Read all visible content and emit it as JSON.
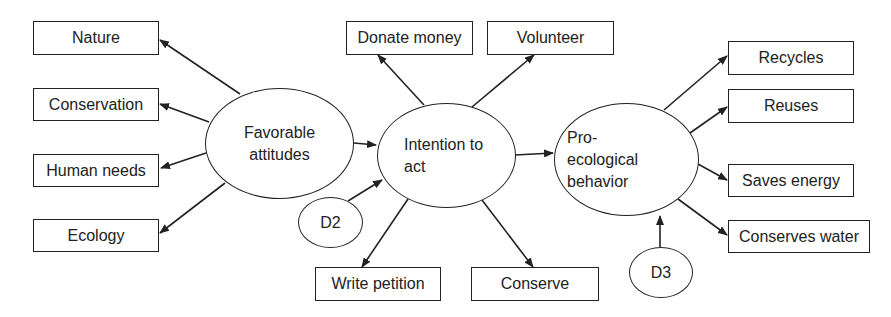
{
  "diagram": {
    "type": "structural-equation-model",
    "latent_constructs": [
      {
        "id": "favorable",
        "label_lines": [
          "Favorable",
          "attitudes"
        ]
      },
      {
        "id": "intention",
        "label_lines": [
          "Intention to",
          "act"
        ]
      },
      {
        "id": "proeco",
        "label_lines": [
          "Pro-",
          "ecological",
          "behavior"
        ]
      }
    ],
    "disturbances": [
      {
        "id": "d2",
        "label": "D2",
        "target": "intention"
      },
      {
        "id": "d3",
        "label": "D3",
        "target": "proeco"
      }
    ],
    "indicators": {
      "favorable": [
        "Nature",
        "Conservation",
        "Human needs",
        "Ecology"
      ],
      "intention": [
        "Donate money",
        "Volunteer",
        "Write petition",
        "Conserve"
      ],
      "proeco": [
        "Recycles",
        "Reuses",
        "Saves energy",
        "Conserves water"
      ]
    },
    "paths": [
      {
        "from": "Favorable attitudes",
        "to": "Intention to act"
      },
      {
        "from": "Intention to act",
        "to": "Pro-ecological behavior"
      }
    ]
  }
}
